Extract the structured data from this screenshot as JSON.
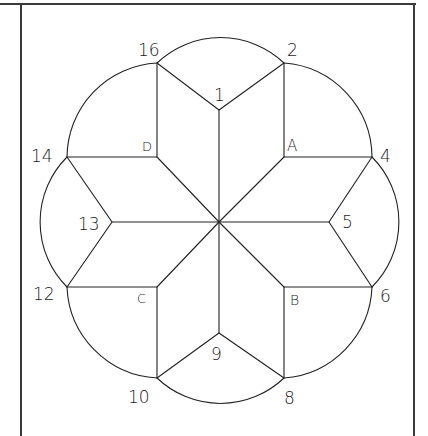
{
  "figure": {
    "type": "star-quilt-pattern",
    "stroke_color": "#222222",
    "frame_color": "#3a3a3a"
  },
  "labels": {
    "p1": "1",
    "p2": "2",
    "p4": "4",
    "p5": "5",
    "p6": "6",
    "p8": "8",
    "p9": "9",
    "p10": "10",
    "p12": "12",
    "p13": "13",
    "p14": "14",
    "p16": "16",
    "A": "A",
    "B": "B",
    "C": "C",
    "D": "D"
  },
  "points": {
    "center": [
      219,
      222
    ],
    "p1": [
      219,
      110
    ],
    "p2": [
      284,
      63
    ],
    "A": [
      284,
      157
    ],
    "p4": [
      372,
      157
    ],
    "p5": [
      329,
      222
    ],
    "p6": [
      372,
      287
    ],
    "B": [
      284,
      287
    ],
    "p8": [
      284,
      378
    ],
    "p9": [
      219,
      333
    ],
    "p10": [
      157,
      378
    ],
    "C": [
      157,
      287
    ],
    "p12": [
      67,
      287
    ],
    "p13": [
      112,
      222
    ],
    "p14": [
      67,
      157
    ],
    "D": [
      157,
      157
    ],
    "p16": [
      157,
      63
    ]
  }
}
